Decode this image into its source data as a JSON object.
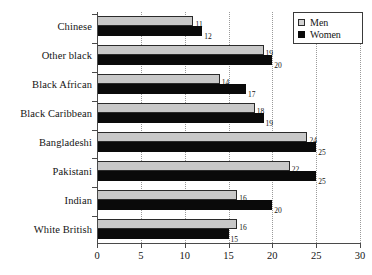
{
  "chart_data": {
    "type": "bar",
    "orientation": "horizontal",
    "title": "",
    "xlabel": "",
    "ylabel": "",
    "xlim": [
      0,
      30
    ],
    "xticks": [
      0,
      5,
      10,
      15,
      20,
      25,
      30
    ],
    "grid": "vertical-dotted",
    "legend_position": "top-right",
    "categories": [
      "Chinese",
      "Other black",
      "Black African",
      "Black Caribbean",
      "Bangladeshi",
      "Pakistani",
      "Indian",
      "White British"
    ],
    "series": [
      {
        "name": "Men",
        "color": "#c8c8c8",
        "values": [
          11,
          19,
          14,
          18,
          24,
          22,
          16,
          16
        ]
      },
      {
        "name": "Women",
        "color": "#0a0a0a",
        "values": [
          12,
          20,
          17,
          19,
          25,
          25,
          20,
          15
        ]
      }
    ]
  },
  "legend": {
    "items": [
      {
        "label": "Men",
        "swatch": "men-swatch-icon"
      },
      {
        "label": "Women",
        "swatch": "women-swatch-icon"
      }
    ]
  },
  "colors": {
    "men_fill": "#c8c8c8",
    "women_fill": "#0a0a0a",
    "axis": "#4a4a4a",
    "gridline": "#9a9a9a",
    "text": "#141414",
    "background": "#ffffff"
  }
}
